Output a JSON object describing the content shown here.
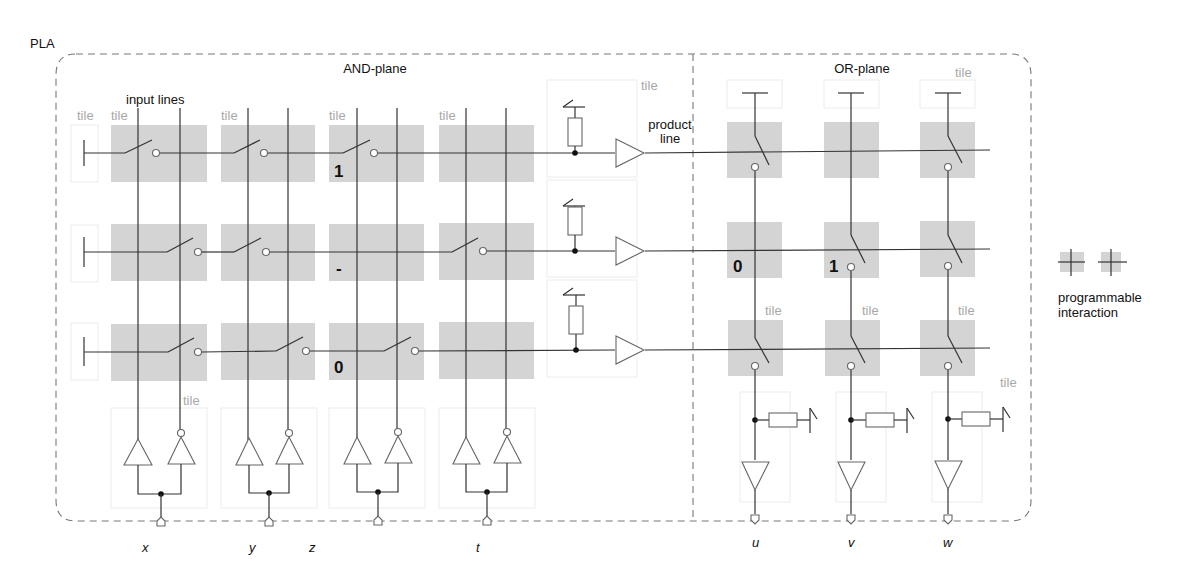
{
  "title": "PLA",
  "planes": {
    "and_plane": {
      "label": "AND-plane"
    },
    "or_plane": {
      "label": "OR-plane"
    }
  },
  "labels": {
    "input_lines": "input lines",
    "product_line": [
      "product",
      "line"
    ],
    "tile": "tile"
  },
  "inputs": [
    "x",
    "y",
    "z",
    "t"
  ],
  "outputs": [
    "u",
    "v",
    "w"
  ],
  "and_plane_programming": [
    {
      "row": 1,
      "marked_cell": 3,
      "value": "1"
    },
    {
      "row": 2,
      "marked_cell": 3,
      "value": "-"
    },
    {
      "row": 3,
      "marked_cell": 3,
      "value": "0"
    }
  ],
  "or_plane_programming": [
    {
      "row": 2,
      "marked_cell": 1,
      "value": "0"
    },
    {
      "row": 2,
      "marked_cell": 2,
      "value": "1"
    }
  ],
  "legend": {
    "label_line1": "programmable",
    "label_line2": "interaction"
  },
  "colors": {
    "tile_fill": "#d4d4d4",
    "wire": "#333333",
    "tile_label": "#a8a8a8",
    "dashed_border": "#777777"
  }
}
